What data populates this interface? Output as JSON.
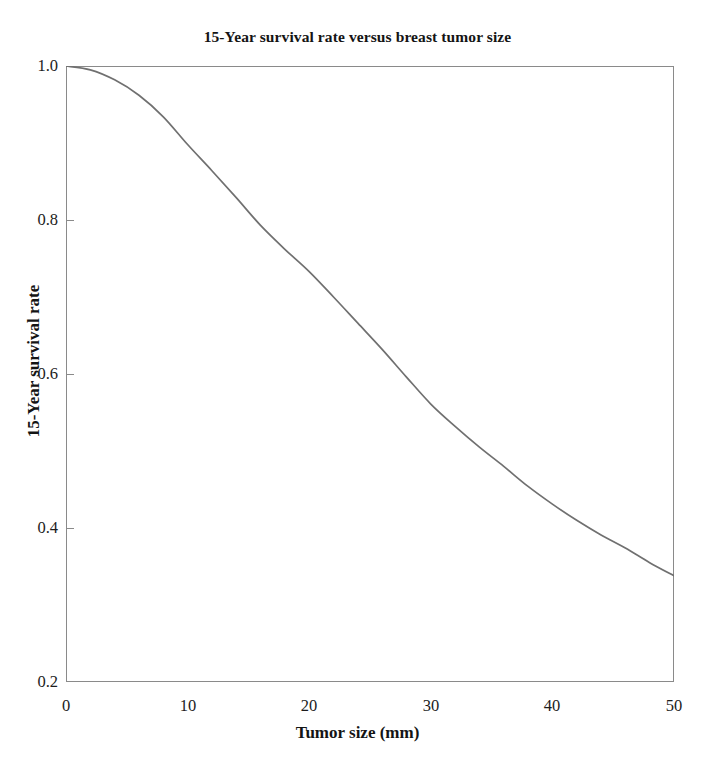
{
  "chart_data": {
    "type": "line",
    "title": "15-Year survival rate versus breast tumor size",
    "xlabel": "Tumor size (mm)",
    "ylabel": "15-Year survival rate",
    "xlim": [
      0,
      50
    ],
    "ylim": [
      0.2,
      1.0
    ],
    "grid": false,
    "legend": null,
    "xticks": [
      "0",
      "10",
      "20",
      "30",
      "40",
      "50"
    ],
    "xtick_values": [
      0,
      10,
      20,
      30,
      40,
      50
    ],
    "yticks": [
      "0.2",
      "0.4",
      "0.6",
      "0.8",
      "1.0"
    ],
    "ytick_values": [
      0.2,
      0.4,
      0.6,
      0.8,
      1.0
    ],
    "line_color": "#707070",
    "series": [
      {
        "name": "15-Year survival rate",
        "x": [
          0,
          2,
          4,
          6,
          8,
          10,
          12,
          14,
          16,
          18,
          20,
          22,
          24,
          26,
          28,
          30,
          32,
          34,
          36,
          38,
          40,
          42,
          44,
          46,
          48,
          50
        ],
        "values": [
          1.0,
          0.995,
          0.982,
          0.962,
          0.934,
          0.898,
          0.864,
          0.829,
          0.793,
          0.762,
          0.733,
          0.7,
          0.666,
          0.632,
          0.596,
          0.561,
          0.532,
          0.505,
          0.48,
          0.454,
          0.431,
          0.41,
          0.391,
          0.374,
          0.355,
          0.338
        ]
      }
    ]
  },
  "axes": {
    "frame_color": "#8a8a8a",
    "background": "#ffffff"
  }
}
